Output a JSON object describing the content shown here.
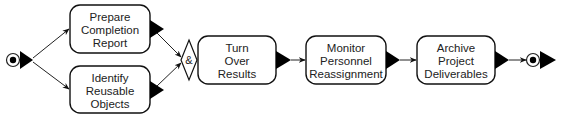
{
  "diagram": {
    "type": "process-flow",
    "start_node": {
      "kind": "start-circle"
    },
    "end_node": {
      "kind": "end-circle"
    },
    "junction": {
      "kind": "and-junction",
      "symbol": "&"
    },
    "activities": [
      {
        "id": "a1",
        "lines": [
          "Prepare",
          "Completion",
          "Report"
        ]
      },
      {
        "id": "a2",
        "lines": [
          "Identify",
          "Reusable",
          "Objects"
        ]
      },
      {
        "id": "a3",
        "lines": [
          "Turn",
          "Over",
          "Results"
        ]
      },
      {
        "id": "a4",
        "lines": [
          "Monitor",
          "Personnel",
          "Reassignment"
        ]
      },
      {
        "id": "a5",
        "lines": [
          "Archive",
          "Project",
          "Deliverables"
        ]
      }
    ],
    "edges": [
      {
        "from": "start",
        "to": "a1"
      },
      {
        "from": "start",
        "to": "a2"
      },
      {
        "from": "a1",
        "to": "junction"
      },
      {
        "from": "a2",
        "to": "junction"
      },
      {
        "from": "junction",
        "to": "a3"
      },
      {
        "from": "a3",
        "to": "a4"
      },
      {
        "from": "a4",
        "to": "a5"
      },
      {
        "from": "a5",
        "to": "end"
      }
    ]
  }
}
